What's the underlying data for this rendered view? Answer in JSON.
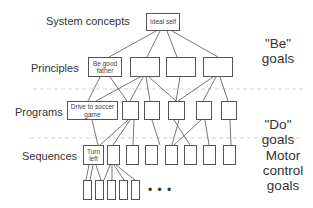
{
  "levels": {
    "system_concepts": "System concepts",
    "principles": "Principles",
    "programs": "Programs",
    "sequences": "Sequences"
  },
  "nodes": {
    "ideal_self": "Ideal self",
    "be_good_father": "Be good father",
    "drive_to_soccer_game": "Drive to soccer game",
    "turn_left": "Turn left"
  },
  "goal_groups": {
    "be_goals": "\"Be\" goals",
    "do_goals": "\"Do\" goals",
    "motor_control_goals": "Motor control goals"
  },
  "ellipsis": "• • •",
  "colors": {
    "line": "#555555",
    "dashed": "#bbbbbb",
    "text": "#333333"
  }
}
